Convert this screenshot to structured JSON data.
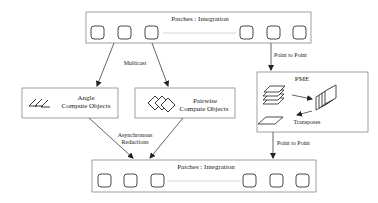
{
  "diagram": {
    "top_box": {
      "title": "Patches : Integration"
    },
    "bottom_box": {
      "title": "Patches : Integration"
    },
    "angle_box": {
      "line1": "Angle",
      "line2": "Compute Objects"
    },
    "pairwise_box": {
      "line1": "Pairwise",
      "line2": "Compute Objects"
    },
    "pme_box": {
      "title": "PME",
      "transposes_label": "Transposes"
    },
    "edges": {
      "multicast": "Multicast",
      "async_line1": "Asynchronous",
      "async_line2": "Reductions",
      "p2p_top": "Point to Point",
      "p2p_bottom": "Point to Point"
    }
  }
}
